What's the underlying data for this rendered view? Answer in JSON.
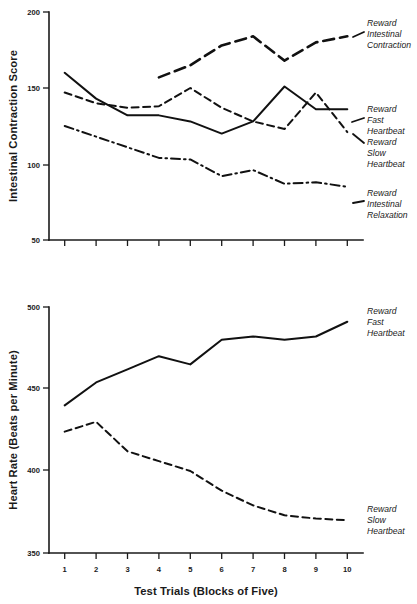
{
  "figure": {
    "panels": [
      {
        "id": "intestinal-contraction-panel",
        "ylabel": "Intestinal Contraction Score",
        "xlabel": "",
        "yticks": [
          "200",
          "150",
          "100",
          "50"
        ],
        "xticklabels": [
          "",
          "",
          "",
          "",
          "",
          "",
          "",
          "",
          "",
          ""
        ],
        "annotations": [
          {
            "lines": [
              "Reward",
              "Intestinal",
              "Contraction"
            ]
          },
          {
            "lines": [
              "Reward",
              "Fast",
              "Heartbeat"
            ]
          },
          {
            "lines": [
              "Reward",
              "Slow",
              "Heartbeat"
            ]
          },
          {
            "lines": [
              "Reward",
              "Intestinal",
              "Relaxation"
            ]
          }
        ]
      },
      {
        "id": "heart-rate-panel",
        "ylabel": "Heart Rate (Beats per Minute)",
        "xlabel": "Test Trials (Blocks of Five)",
        "yticks": [
          "500",
          "450",
          "400",
          "350"
        ],
        "xticklabels": [
          "1",
          "2",
          "3",
          "4",
          "5",
          "6",
          "7",
          "8",
          "9",
          "10"
        ],
        "annotations": [
          {
            "lines": [
              "Reward",
              "Fast",
              "Heartbeat"
            ]
          },
          {
            "lines": [
              "Reward",
              "Slow",
              "Heartbeat"
            ]
          }
        ]
      }
    ],
    "colors": {
      "ink": "#111111",
      "axis": "#1a1a1a",
      "background": "#ffffff"
    }
  },
  "chart_data": [
    {
      "type": "line",
      "title": "",
      "xlabel": "Test Trials (Blocks of Five)",
      "ylabel": "Intestinal Contraction Score",
      "x": [
        1,
        2,
        3,
        4,
        5,
        6,
        7,
        8,
        9,
        10
      ],
      "xlim": [
        0.5,
        10.5
      ],
      "ylim": [
        50,
        200
      ],
      "yticks": [
        50,
        100,
        150,
        200
      ],
      "grid": false,
      "legend_position": "right-inline-annotations",
      "series": [
        {
          "name": "Reward Intestinal Contraction",
          "style": "long-dash",
          "x": [
            4,
            5,
            6,
            7,
            8,
            9,
            10
          ],
          "values": [
            157,
            165,
            178,
            184,
            168,
            180,
            184
          ]
        },
        {
          "name": "Reward Fast Heartbeat",
          "style": "solid",
          "x": [
            1,
            2,
            3,
            4,
            5,
            6,
            7,
            8,
            9,
            10
          ],
          "values": [
            160,
            143,
            132,
            132,
            128,
            120,
            128,
            151,
            136,
            136
          ]
        },
        {
          "name": "Reward Slow Heartbeat",
          "style": "dashed",
          "x": [
            1,
            2,
            3,
            4,
            5,
            6,
            7,
            8,
            9,
            10
          ],
          "values": [
            147,
            140,
            137,
            138,
            150,
            137,
            128,
            123,
            147,
            121
          ]
        },
        {
          "name": "Reward Intestinal Relaxation",
          "style": "dash-dot",
          "x": [
            1,
            2,
            3,
            4,
            5,
            6,
            7,
            8,
            9,
            10
          ],
          "values": [
            125,
            118,
            111,
            104,
            103,
            92,
            96,
            87,
            88,
            85
          ]
        }
      ]
    },
    {
      "type": "line",
      "title": "",
      "xlabel": "Test Trials (Blocks of Five)",
      "ylabel": "Heart Rate (Beats per Minute)",
      "x": [
        1,
        2,
        3,
        4,
        5,
        6,
        7,
        8,
        9,
        10
      ],
      "xlim": [
        0.5,
        10.5
      ],
      "ylim": [
        350,
        500
      ],
      "yticks": [
        350,
        400,
        450,
        500
      ],
      "grid": false,
      "legend_position": "right-inline-annotations",
      "series": [
        {
          "name": "Reward Fast Heartbeat",
          "style": "solid",
          "x": [
            1,
            2,
            3,
            4,
            5,
            6,
            7,
            8,
            9,
            10
          ],
          "values": [
            440,
            454,
            462,
            470,
            465,
            480,
            482,
            480,
            482,
            491
          ]
        },
        {
          "name": "Reward Slow Heartbeat",
          "style": "dashed",
          "x": [
            1,
            2,
            3,
            4,
            5,
            6,
            7,
            8,
            9,
            10
          ],
          "values": [
            424,
            430,
            412,
            406,
            400,
            388,
            379,
            373,
            371,
            370
          ]
        }
      ]
    }
  ]
}
